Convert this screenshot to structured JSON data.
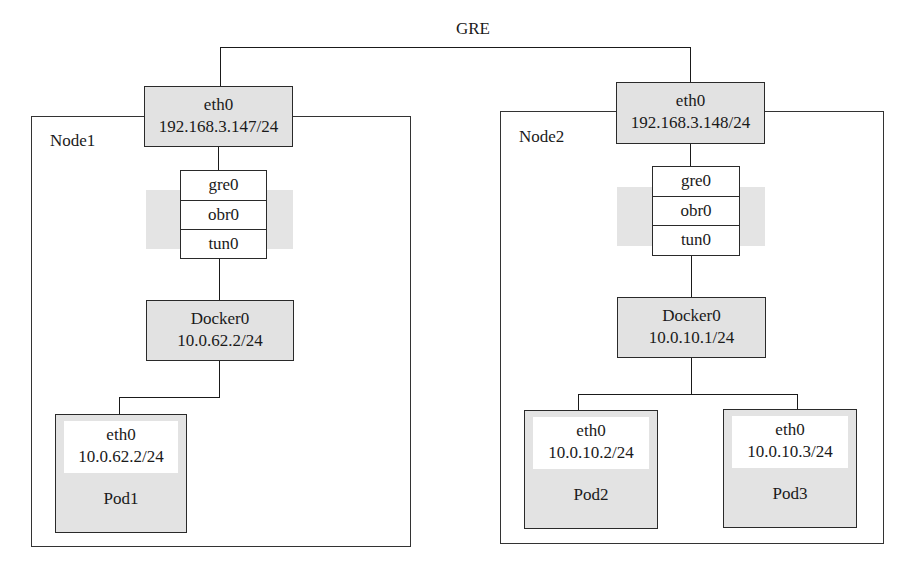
{
  "diagram": {
    "link_label": "GRE",
    "nodes": [
      {
        "label": "Node1",
        "eth0": {
          "name": "eth0",
          "ip": "192.168.3.147/24"
        },
        "stack": [
          "gre0",
          "obr0",
          "tun0"
        ],
        "docker": {
          "name": "Docker0",
          "ip": "10.0.62.2/24"
        },
        "pods": [
          {
            "iface": "eth0",
            "ip": "10.0.62.2/24",
            "name": "Pod1"
          }
        ]
      },
      {
        "label": "Node2",
        "eth0": {
          "name": "eth0",
          "ip": "192.168.3.148/24"
        },
        "stack": [
          "gre0",
          "obr0",
          "tun0"
        ],
        "docker": {
          "name": "Docker0",
          "ip": "10.0.10.1/24"
        },
        "pods": [
          {
            "iface": "eth0",
            "ip": "10.0.10.2/24",
            "name": "Pod2"
          },
          {
            "iface": "eth0",
            "ip": "10.0.10.3/24",
            "name": "Pod3"
          }
        ]
      }
    ]
  }
}
